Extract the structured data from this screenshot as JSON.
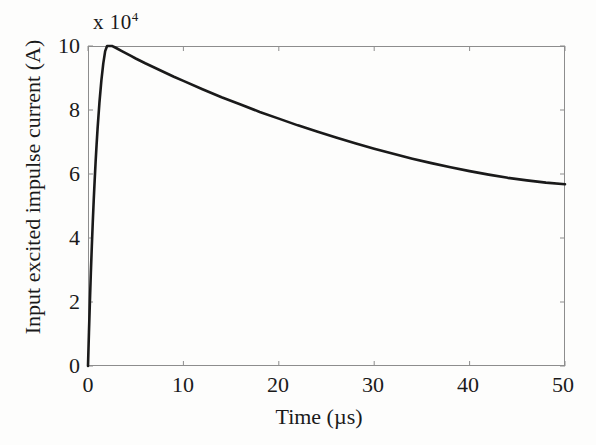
{
  "figure": {
    "background_color": "#fdfdfc",
    "axis_color": "#8d8d8d",
    "curve_color": "#1a1a1a",
    "text_color": "#1a1a1a"
  },
  "axes": {
    "y_multiplier_prefix": "x 10",
    "y_multiplier_exponent": "4",
    "y_axis_title": "Input excited impulse current (A)",
    "x_axis_title": "Time (µs)",
    "y_ticks": [
      "0",
      "2",
      "4",
      "6",
      "8",
      "10"
    ],
    "x_ticks": [
      "0",
      "10",
      "20",
      "30",
      "40",
      "50"
    ]
  },
  "chart_data": {
    "type": "line",
    "title": "",
    "subtitle": "",
    "xlabel": "Time (µs)",
    "ylabel": "Input excited impulse current (A)",
    "xlim": [
      0,
      50
    ],
    "ylim": [
      0,
      10
    ],
    "y_scale_multiplier": 10000,
    "y_scale_label": "x 10^4",
    "xticks": [
      0,
      10,
      20,
      30,
      40,
      50
    ],
    "yticks": [
      0,
      2,
      4,
      6,
      8,
      10
    ],
    "grid": false,
    "legend": null,
    "legend_position": "none",
    "annotations": [],
    "series": [
      {
        "name": "Input excited impulse current",
        "color": "#1a1a1a",
        "line_width": 2.6,
        "waveform": "double-exponential impulse (approx. 2.6/50 µs)",
        "peak_value": 10.0,
        "peak_time": 2.5,
        "end_value": 5.7,
        "x": [
          0,
          0.1,
          0.2,
          0.3,
          0.4,
          0.5,
          0.6,
          0.7,
          0.8,
          0.9,
          1.0,
          1.2,
          1.4,
          1.6,
          1.8,
          2.0,
          2.2,
          2.4,
          2.5,
          2.6,
          2.8,
          3.0,
          3.5,
          4.0,
          4.5,
          5.0,
          6.0,
          7.0,
          8.0,
          9.0,
          10.0,
          12.0,
          14.0,
          16.0,
          18.0,
          20.0,
          22.0,
          24.0,
          26.0,
          28.0,
          30.0,
          32.0,
          34.0,
          36.0,
          38.0,
          40.0,
          42.0,
          44.0,
          46.0,
          48.0,
          50.0
        ],
        "y": [
          0.0,
          1.05,
          2.02,
          2.92,
          3.74,
          4.49,
          5.18,
          5.81,
          6.39,
          6.92,
          7.4,
          8.24,
          8.92,
          9.45,
          9.84,
          10.0,
          10.0,
          10.0,
          10.0,
          9.99,
          9.96,
          9.93,
          9.85,
          9.77,
          9.69,
          9.61,
          9.46,
          9.32,
          9.18,
          9.04,
          8.91,
          8.65,
          8.4,
          8.17,
          7.94,
          7.73,
          7.52,
          7.33,
          7.14,
          6.96,
          6.79,
          6.63,
          6.48,
          6.34,
          6.21,
          6.09,
          5.98,
          5.88,
          5.8,
          5.73,
          5.68
        ]
      }
    ]
  }
}
